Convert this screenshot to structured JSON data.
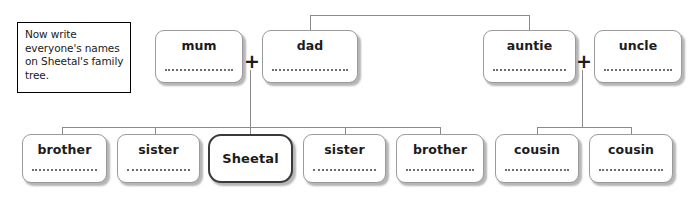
{
  "worksheet": {
    "instruction": "Now write everyone's names on Sheetal's family tree.",
    "focus_person": "Sheetal"
  },
  "symbols": {
    "plus": "+"
  },
  "generation_parents": [
    {
      "role": "mum",
      "writing_line": true,
      "name_value": ""
    },
    {
      "role": "dad",
      "writing_line": true,
      "name_value": ""
    },
    {
      "role": "auntie",
      "writing_line": true,
      "name_value": ""
    },
    {
      "role": "uncle",
      "writing_line": true,
      "name_value": ""
    }
  ],
  "generation_children": [
    {
      "role": "brother",
      "writing_line": true,
      "name_value": ""
    },
    {
      "role": "sister",
      "writing_line": true,
      "name_value": ""
    },
    {
      "role": "Sheetal",
      "writing_line": false,
      "name_value": "Sheetal"
    },
    {
      "role": "sister",
      "writing_line": true,
      "name_value": ""
    },
    {
      "role": "brother",
      "writing_line": true,
      "name_value": ""
    },
    {
      "role": "cousin",
      "writing_line": true,
      "name_value": ""
    },
    {
      "role": "cousin",
      "writing_line": true,
      "name_value": ""
    }
  ],
  "couples": [
    {
      "left": "mum",
      "right": "dad",
      "symbol": "+"
    },
    {
      "left": "auntie",
      "right": "uncle",
      "symbol": "+"
    }
  ],
  "colors": {
    "background": "#ffffff",
    "card_border": "#9a9a9a",
    "focus_border": "#3a3a3a",
    "connector": "#8a8a8a",
    "text": "#1c1c1c",
    "instruction_border": "#000000"
  }
}
